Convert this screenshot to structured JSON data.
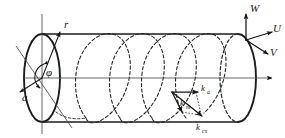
{
  "figure": {
    "name": "cylindrical-waveguide-coordinate-diagram",
    "background_color": "#ffffff",
    "line_color": "#1a1a1a",
    "axis_color": "#4a4a4a"
  },
  "labels": {
    "radial_axis": "r",
    "azimuth_angle": "φ",
    "radius": "a",
    "axis_w": "W",
    "axis_u": "U",
    "axis_v": "V",
    "k_axial": "k",
    "k_axial_sub": "a",
    "k_meridional": "k",
    "k_meridional_sub": "m",
    "k_cross_section": "k",
    "k_cross_section_sub": "cs"
  },
  "geometry": {
    "cylinder_left_center_x": 42,
    "cylinder_right_center_x": 238,
    "cylinder_center_y": 78,
    "cap_radius_x": 18,
    "cap_radius_y": 44,
    "helix_turns": 4
  },
  "elements": {
    "left_cap": "solid-ellipse",
    "right_cap": "solid-ellipse-with-dashed-back",
    "interior_path": "dashed-helix",
    "centerline": "horizontal-axis-with-arrowhead",
    "vertical_reference": "vertical-line-through-left-cap",
    "diagonal_reference": "diagonal-line-through-left-cap"
  }
}
